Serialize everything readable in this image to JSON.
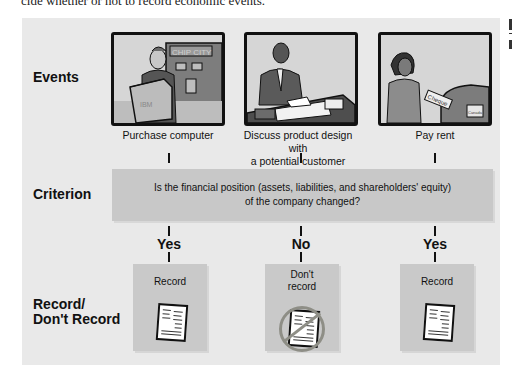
{
  "intro_text": "cide whether or not to record economic events.",
  "row_labels": {
    "events": "Events",
    "criterion": "Criterion",
    "record_line1": "Record/",
    "record_line2": "Don't Record"
  },
  "events": [
    {
      "caption_line1": "Purchase computer",
      "caption_line2": "",
      "image": "man-carrying-ibm-box-at-chip-city",
      "box_text": "IBM",
      "sign_text": "CHIP CITY"
    },
    {
      "caption_line1": "Discuss product design with",
      "caption_line2": "a potential customer",
      "image": "man-on-phone-at-desk"
    },
    {
      "caption_line1": "Pay rent",
      "caption_line2": "",
      "image": "woman-mailing-cheque",
      "cheque_text": "Cheque",
      "mailbox_text": "Canada"
    }
  ],
  "criterion": {
    "line1": "Is the financial position (assets, liabilities, and shareholders' equity)",
    "line2": "of the company changed?"
  },
  "answers": [
    "Yes",
    "No",
    "Yes"
  ],
  "outcomes": [
    {
      "line1": "Record",
      "line2": "",
      "crossed_out": false
    },
    {
      "line1": "Don't",
      "line2": "record",
      "crossed_out": true
    },
    {
      "line1": "Record",
      "line2": "",
      "crossed_out": false
    }
  ],
  "colors": {
    "panel_bg": "#e9e9e9",
    "box_bg": "#c8c8c8",
    "no_symbol": "#8e8e86",
    "text": "#111111"
  }
}
